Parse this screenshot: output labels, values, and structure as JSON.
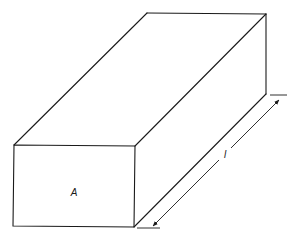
{
  "diagram": {
    "type": "rectangular-prism",
    "labels": {
      "front_face": "A",
      "length": "l"
    },
    "colors": {
      "line": "#1a1a1a",
      "background": "#ffffff"
    }
  }
}
